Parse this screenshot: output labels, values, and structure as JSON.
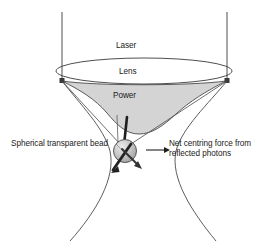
{
  "figure": {
    "background_color": "#ffffff",
    "width": 266,
    "height": 246
  },
  "labels": {
    "laser": "Laser",
    "lens": "Lens",
    "power": "Power",
    "bead": "Spherical transparent bead",
    "force_line1": "Net centring force from",
    "force_line2": "reflected photons"
  },
  "colors": {
    "stroke": "#3a3a3a",
    "text": "#1a1a1a",
    "power_fill": "#d4d4d4",
    "bead_fill": "#b9b9b9",
    "bead_highlight": "#e2e2e2",
    "arrow_dark": "#262626"
  },
  "geometry": {
    "laser_beam_left_x": 62,
    "laser_beam_right_x": 227,
    "laser_beam_top_y": 12,
    "lens_center_x": 144,
    "lens_center_y": 71,
    "lens_radius_x": 88,
    "lens_radius_y": 13,
    "beam_waist_y": 150,
    "bead_center_x": 125,
    "bead_center_y": 151,
    "bead_radius": 12,
    "force_arrow_start_x": 146,
    "force_arrow_end_x": 170,
    "force_arrow_y": 150
  },
  "elements": [
    {
      "name": "laser-beam-left-ray",
      "type": "line"
    },
    {
      "name": "laser-beam-right-ray",
      "type": "line"
    },
    {
      "name": "lens-ellipse",
      "type": "ellipse"
    },
    {
      "name": "power-profile-region",
      "type": "filled-curve"
    },
    {
      "name": "beam-waist-left-curve",
      "type": "curve"
    },
    {
      "name": "beam-waist-right-curve",
      "type": "curve"
    },
    {
      "name": "converging-ray-left",
      "type": "line"
    },
    {
      "name": "converging-ray-right",
      "type": "line"
    },
    {
      "name": "bead-sphere",
      "type": "circle"
    },
    {
      "name": "reflected-photon-arrow-left",
      "type": "arrow"
    },
    {
      "name": "reflected-photon-arrow-right",
      "type": "arrow"
    },
    {
      "name": "net-force-arrow",
      "type": "arrow"
    }
  ]
}
